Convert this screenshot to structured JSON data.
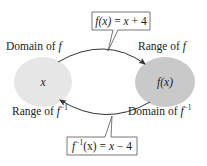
{
  "diagram": {
    "left_set": {
      "label": "x",
      "fill": "#e6e6e6"
    },
    "right_set": {
      "label": "f(x)",
      "fill": "#c9c9c9"
    },
    "labels": {
      "domain_f": {
        "prefix": "Domain of ",
        "var": "f"
      },
      "range_f": {
        "prefix": "Range of ",
        "var": "f"
      },
      "range_finv": {
        "prefix": "Range of ",
        "var": "f",
        "sup": "−1"
      },
      "domain_finv": {
        "prefix": "Domain of ",
        "var": "f",
        "sup": "−1"
      }
    },
    "top_formula": {
      "lhs": "f(x)",
      "eq": " = ",
      "rhs_var": "x",
      "rhs_rest": " + 4"
    },
    "bottom_formula": {
      "lhs_var": "f",
      "lhs_sup": "−1",
      "lhs_arg": "(x)",
      "eq": " = ",
      "rhs_var": "x",
      "rhs_rest": " − 4"
    },
    "colors": {
      "stroke": "#333333",
      "box_border": "#555555"
    }
  }
}
